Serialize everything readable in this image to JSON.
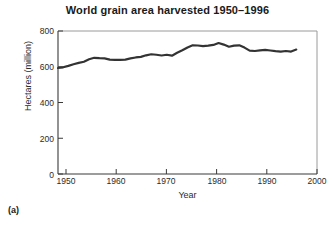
{
  "figure": {
    "panel_label": "(a)",
    "background_color": "#ffffff",
    "frame_color": "#9a9a9a",
    "axis_color": "#3a3a3a",
    "line_color": "#333333"
  },
  "chart_data": {
    "type": "line",
    "title": "World grain area harvested 1950–1996",
    "xlabel": "Year",
    "ylabel": "Hectares (million)",
    "xlim": [
      1950,
      2000
    ],
    "ylim": [
      0,
      800
    ],
    "xticks": [
      1950,
      1960,
      1970,
      1980,
      1990,
      2000
    ],
    "xtick_labels": [
      "1950",
      "1960",
      "1970",
      "1980",
      "1990",
      "2000"
    ],
    "yticks": [
      0,
      200,
      400,
      600,
      800
    ],
    "ytick_labels": [
      "0",
      "200",
      "400",
      "600",
      "800"
    ],
    "grid": false,
    "legend": null,
    "series": [
      {
        "name": "World grain area harvested",
        "units": "million hectares",
        "color": "#333333",
        "line_width": 2.2,
        "x": [
          1950,
          1951,
          1952,
          1953,
          1954,
          1955,
          1956,
          1957,
          1958,
          1959,
          1960,
          1961,
          1962,
          1963,
          1964,
          1965,
          1966,
          1967,
          1968,
          1969,
          1970,
          1971,
          1972,
          1973,
          1974,
          1975,
          1976,
          1977,
          1978,
          1979,
          1980,
          1981,
          1982,
          1983,
          1984,
          1985,
          1986,
          1987,
          1988,
          1989,
          1990,
          1991,
          1992,
          1993,
          1994,
          1995,
          1996
        ],
        "values": [
          593,
          597,
          605,
          614,
          622,
          628,
          642,
          650,
          648,
          647,
          640,
          639,
          639,
          640,
          647,
          652,
          655,
          664,
          670,
          667,
          663,
          667,
          662,
          678,
          692,
          708,
          720,
          719,
          715,
          718,
          722,
          733,
          724,
          712,
          718,
          720,
          707,
          690,
          688,
          692,
          694,
          691,
          687,
          685,
          688,
          685,
          696
        ]
      }
    ]
  }
}
